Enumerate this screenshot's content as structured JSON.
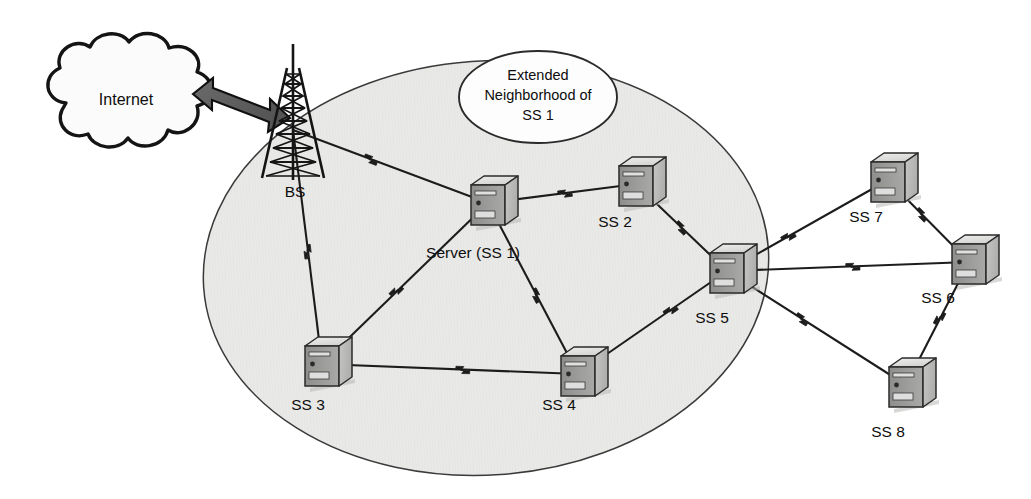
{
  "diagram": {
    "type": "network-topology",
    "background_color": "#ffffff",
    "coverage_area": {
      "name": "coverage-ellipse",
      "fill_color": "#e9e9e7",
      "stroke_color": "#3a3a3a",
      "cx": 486,
      "cy": 268,
      "rx": 283,
      "ry": 207,
      "rotation": -4
    },
    "cloud": {
      "label": "Internet",
      "cx": 126,
      "cy": 99,
      "fill_color": "#fbfbfb",
      "stroke_color": "#141414"
    },
    "arrow": {
      "name": "internet-bs-link",
      "fill_color": "#5e5e5e",
      "stroke_color": "#101010",
      "direction": "bidirectional"
    },
    "tower": {
      "label": "BS",
      "name": "base-station-tower",
      "x": 293,
      "y": 112,
      "label_x": 295,
      "label_y": 194,
      "color": "#1a1a1a"
    },
    "callout": {
      "name": "extended-neighborhood-callout",
      "lines": [
        "Extended",
        "Neighborhood of",
        "SS 1"
      ],
      "cx": 538,
      "cy": 97,
      "rx": 79,
      "ry": 46,
      "fill_color": "#fdfdfd",
      "stroke_color": "#2a2a2a"
    },
    "nodes": [
      {
        "id": "ss1",
        "label": "Server (SS 1)",
        "x": 488,
        "y": 203,
        "label_x": 473,
        "label_y": 258,
        "label_anchor": "middle",
        "inside_coverage": true
      },
      {
        "id": "ss2",
        "label": "SS 2",
        "x": 636,
        "y": 184,
        "label_x": 615,
        "label_y": 227,
        "label_anchor": "middle",
        "inside_coverage": true
      },
      {
        "id": "ss3",
        "label": "SS 3",
        "x": 322,
        "y": 364,
        "label_x": 308,
        "label_y": 410,
        "label_anchor": "middle",
        "inside_coverage": true
      },
      {
        "id": "ss4",
        "label": "SS 4",
        "x": 578,
        "y": 374,
        "label_x": 559,
        "label_y": 410,
        "label_anchor": "middle",
        "inside_coverage": true
      },
      {
        "id": "ss5",
        "label": "SS 5",
        "x": 727,
        "y": 271,
        "label_x": 712,
        "label_y": 323,
        "label_anchor": "middle",
        "inside_coverage": true
      },
      {
        "id": "ss6",
        "label": "SS 6",
        "x": 969,
        "y": 262,
        "label_x": 938,
        "label_y": 303,
        "label_anchor": "middle",
        "inside_coverage": false
      },
      {
        "id": "ss7",
        "label": "SS 7",
        "x": 888,
        "y": 180,
        "label_x": 866,
        "label_y": 222,
        "label_anchor": "middle",
        "inside_coverage": false
      },
      {
        "id": "ss8",
        "label": "SS 8",
        "x": 906,
        "y": 385,
        "label_x": 888,
        "label_y": 437,
        "label_anchor": "middle",
        "inside_coverage": false
      }
    ],
    "links": [
      {
        "from": "bs",
        "to": "ss1",
        "zigzag_at": 0.4
      },
      {
        "from": "bs",
        "to": "ss3",
        "zigzag_at": 0.52
      },
      {
        "from": "ss1",
        "to": "ss2",
        "zigzag_at": 0.52
      },
      {
        "from": "ss1",
        "to": "ss3",
        "zigzag_at": 0.55
      },
      {
        "from": "ss1",
        "to": "ss4",
        "zigzag_at": 0.54
      },
      {
        "from": "ss2",
        "to": "ss5",
        "zigzag_at": 0.5
      },
      {
        "from": "ss3",
        "to": "ss4",
        "zigzag_at": 0.55
      },
      {
        "from": "ss4",
        "to": "ss5",
        "zigzag_at": 0.62
      },
      {
        "from": "ss5",
        "to": "ss7",
        "zigzag_at": 0.38
      },
      {
        "from": "ss5",
        "to": "ss6",
        "zigzag_at": 0.52
      },
      {
        "from": "ss5",
        "to": "ss8",
        "zigzag_at": 0.42
      },
      {
        "from": "ss7",
        "to": "ss6",
        "zigzag_at": 0.42
      },
      {
        "from": "ss6",
        "to": "ss8",
        "zigzag_at": 0.46
      }
    ],
    "link_style": {
      "stroke_color": "#1c1c1c",
      "stroke_width": 2.1,
      "zigzag_color": "#1c1c1c"
    },
    "node_style": {
      "top_face": "#e3e3e1",
      "front_face": "#9c9c9a",
      "side_face": "#bdbdbb",
      "outline": "#2b2b2b",
      "shadow": "#b8b8b6",
      "width": 34,
      "height": 40
    }
  }
}
